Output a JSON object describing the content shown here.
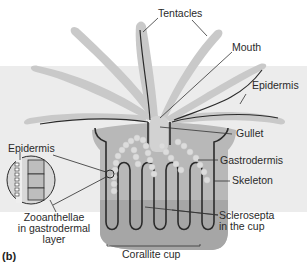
{
  "figure": {
    "panel_label": "(b)",
    "colors": {
      "background": "#ffffff",
      "band": "#ececec",
      "tentacle": "#c8c8c8",
      "body": "#b4b4b4",
      "skeleton": "#a2a2a2",
      "gastrodermis_line": "#2b2b2b",
      "zooxanthellae": "#dadada",
      "label_text": "#2a2a2a"
    },
    "labels": {
      "tentacles": "Tentacles",
      "mouth": "Mouth",
      "epidermis_right": "Epidermis",
      "gullet": "Gullet",
      "gastrodermis": "Gastrodermis",
      "skeleton": "Skeleton",
      "epidermis_left": "Epidermis",
      "zooxanthellae_line1": "Zooanthellae",
      "zooxanthellae_line2": "in gastrodermal",
      "zooxanthellae_line3": "layer",
      "sclerosepta_line1": "Sclerosepta",
      "sclerosepta_line2": "in the cup",
      "corallite_cup": "Corallite cup"
    }
  }
}
